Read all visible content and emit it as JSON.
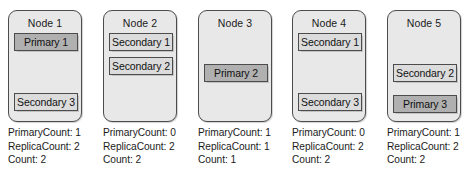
{
  "diagram": {
    "colors": {
      "card_fill": "#e8e8e8",
      "card_border": "#4c4c4c",
      "primary_fill": "#b0b0b0",
      "secondary_fill": "#dcdcdc",
      "text": "#1b1b1b"
    },
    "stat_labels": {
      "primary_count": "PrimaryCount:",
      "replica_count": "ReplicaCount:",
      "count": "Count:"
    },
    "nodes": [
      {
        "title": "Node 1",
        "replicas": [
          {
            "label": "Primary 1",
            "role": "primary",
            "slot": 0
          },
          {
            "label": "Secondary 3",
            "role": "secondary",
            "slot": 3
          }
        ],
        "stats": {
          "primary_count": "PrimaryCount: 1",
          "replica_count": "ReplicaCount: 2",
          "count": "Count: 2"
        }
      },
      {
        "title": "Node 2",
        "replicas": [
          {
            "label": "Secondary 1",
            "role": "secondary",
            "slot": 0
          },
          {
            "label": "Secondary 2",
            "role": "secondary",
            "slot": 1
          }
        ],
        "stats": {
          "primary_count": "PrimaryCount: 0",
          "replica_count": "ReplicaCount: 2",
          "count": "Count: 2"
        }
      },
      {
        "title": "Node 3",
        "replicas": [
          {
            "label": "Primary 2",
            "role": "primary",
            "slot": 2
          }
        ],
        "stats": {
          "primary_count": "PrimaryCount: 1",
          "replica_count": "ReplicaCount: 1",
          "count": "Count: 1"
        }
      },
      {
        "title": "Node 4",
        "replicas": [
          {
            "label": "Secondary 1",
            "role": "secondary",
            "slot": 0
          },
          {
            "label": "Secondary 3",
            "role": "secondary",
            "slot": 3
          }
        ],
        "stats": {
          "primary_count": "PrimaryCount: 0",
          "replica_count": "ReplicaCount: 2",
          "count": "Count: 2"
        }
      },
      {
        "title": "Node 5",
        "replicas": [
          {
            "label": "Secondary 2",
            "role": "secondary",
            "slot": 2
          },
          {
            "label": "Primary 3",
            "role": "primary",
            "slot": 4
          }
        ],
        "stats": {
          "primary_count": "PrimaryCount: 1",
          "replica_count": "ReplicaCount: 2",
          "count": "Count: 2"
        }
      }
    ]
  }
}
